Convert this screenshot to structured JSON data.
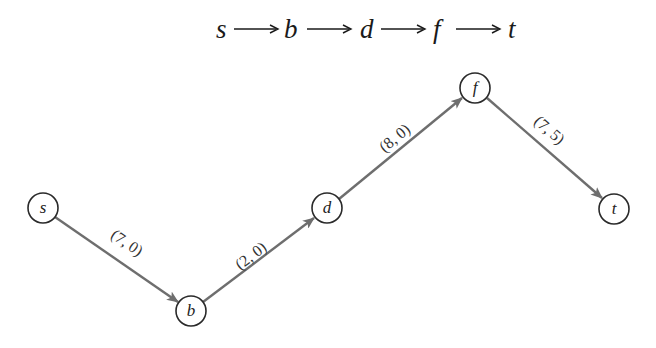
{
  "header": {
    "path_sequence": [
      "s",
      "b",
      "d",
      "f",
      "t"
    ],
    "arrow_glyph": "long-right-arrow"
  },
  "graph": {
    "nodes": [
      {
        "id": "s",
        "label": "s",
        "x": 43,
        "y": 208
      },
      {
        "id": "b",
        "label": "b",
        "x": 191,
        "y": 311
      },
      {
        "id": "d",
        "label": "d",
        "x": 327,
        "y": 208
      },
      {
        "id": "f",
        "label": "f",
        "x": 475,
        "y": 88
      },
      {
        "id": "t",
        "label": "t",
        "x": 614,
        "y": 209
      }
    ],
    "edges": [
      {
        "from": "s",
        "to": "b",
        "label": "(7, 0)"
      },
      {
        "from": "b",
        "to": "d",
        "label": "(2, 0)"
      },
      {
        "from": "d",
        "to": "f",
        "label": "(8, 0)"
      },
      {
        "from": "f",
        "to": "t",
        "label": "(7, 5)"
      }
    ],
    "node_radius": 15,
    "colors": {
      "edge": "#6e6e6e",
      "node_stroke": "#2a2a2a",
      "text": "#222222",
      "background": "#ffffff"
    }
  }
}
